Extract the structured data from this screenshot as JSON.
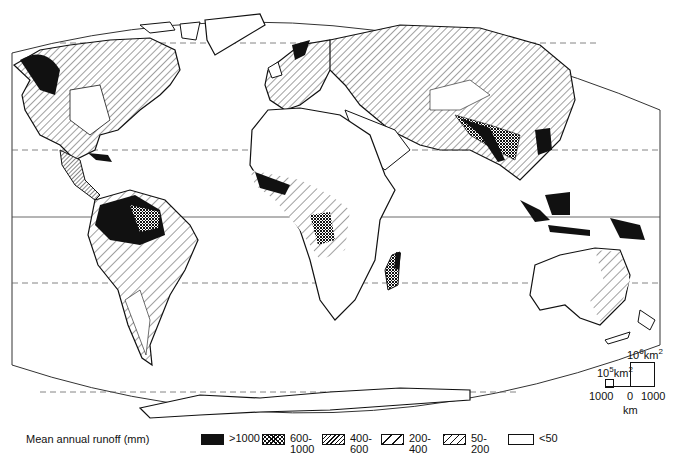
{
  "map": {
    "title": "World mean annual runoff",
    "projection_frame": true,
    "graticule": {
      "equator": "solid",
      "tropics": "dashed",
      "polar_circles": "dashed"
    }
  },
  "legend": {
    "title": "Mean annual runoff (mm)",
    "items": [
      {
        "label": ">1000",
        "pattern": "solid-black"
      },
      {
        "label": "600-\n1000",
        "pattern": "crosshatch-dense"
      },
      {
        "label": "400-\n600",
        "pattern": "hatch-dense"
      },
      {
        "label": "200-\n400",
        "pattern": "hatch-wide"
      },
      {
        "label": "50-\n200",
        "pattern": "hatch-medium"
      },
      {
        "label": "<50",
        "pattern": "blank"
      }
    ]
  },
  "scale": {
    "large_box_label": "10",
    "large_box_exp": "6",
    "large_box_unit": "km",
    "large_box_unit_exp": "2",
    "small_box_label": "10",
    "small_box_exp": "5",
    "small_box_unit": "km",
    "small_box_unit_exp": "2",
    "left_tick": "1000",
    "zero_tick": "0",
    "right_tick": "1000",
    "unit": "km"
  }
}
